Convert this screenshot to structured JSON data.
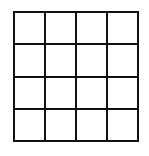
{
  "diagram": {
    "type": "grid",
    "rows": 4,
    "columns": 4,
    "line_color": "#111111",
    "fill_color": "#ffffff",
    "cells": [
      [
        "",
        "",
        "",
        ""
      ],
      [
        "",
        "",
        "",
        ""
      ],
      [
        "",
        "",
        "",
        ""
      ],
      [
        "",
        "",
        "",
        ""
      ]
    ]
  }
}
